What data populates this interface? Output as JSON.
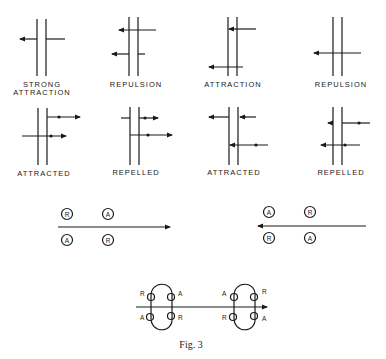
{
  "figure": {
    "caption": "Fig. 3",
    "colors": {
      "ink": "#1a1a1a",
      "background": "#ffffff"
    }
  },
  "row1": {
    "panels": [
      {
        "label_line1": "STRONG",
        "label_line2": "ATTRACTION"
      },
      {
        "label_line1": "REPULSION"
      },
      {
        "label_line1": "ATTRACTION"
      },
      {
        "label_line1": "REPULSION"
      }
    ]
  },
  "row2": {
    "panels": [
      {
        "label": "ATTRACTED"
      },
      {
        "label": "REPELLED"
      },
      {
        "label": "ATTRACTED"
      },
      {
        "label": "REPELLED"
      }
    ]
  },
  "row3": {
    "left": {
      "direction": "right",
      "top": [
        "R",
        "A"
      ],
      "bottom": [
        "A",
        "R"
      ]
    },
    "right": {
      "direction": "left",
      "top": [
        "A",
        "R"
      ],
      "bottom": [
        "R",
        "A"
      ]
    }
  },
  "row4": {
    "loop_left": {
      "top_left": "R",
      "top_right": "A",
      "bottom_left": "A",
      "bottom_right": "R"
    },
    "loop_right": {
      "top_left": "A",
      "top_right": "R",
      "bottom_left": "R",
      "bottom_right": "A"
    }
  }
}
